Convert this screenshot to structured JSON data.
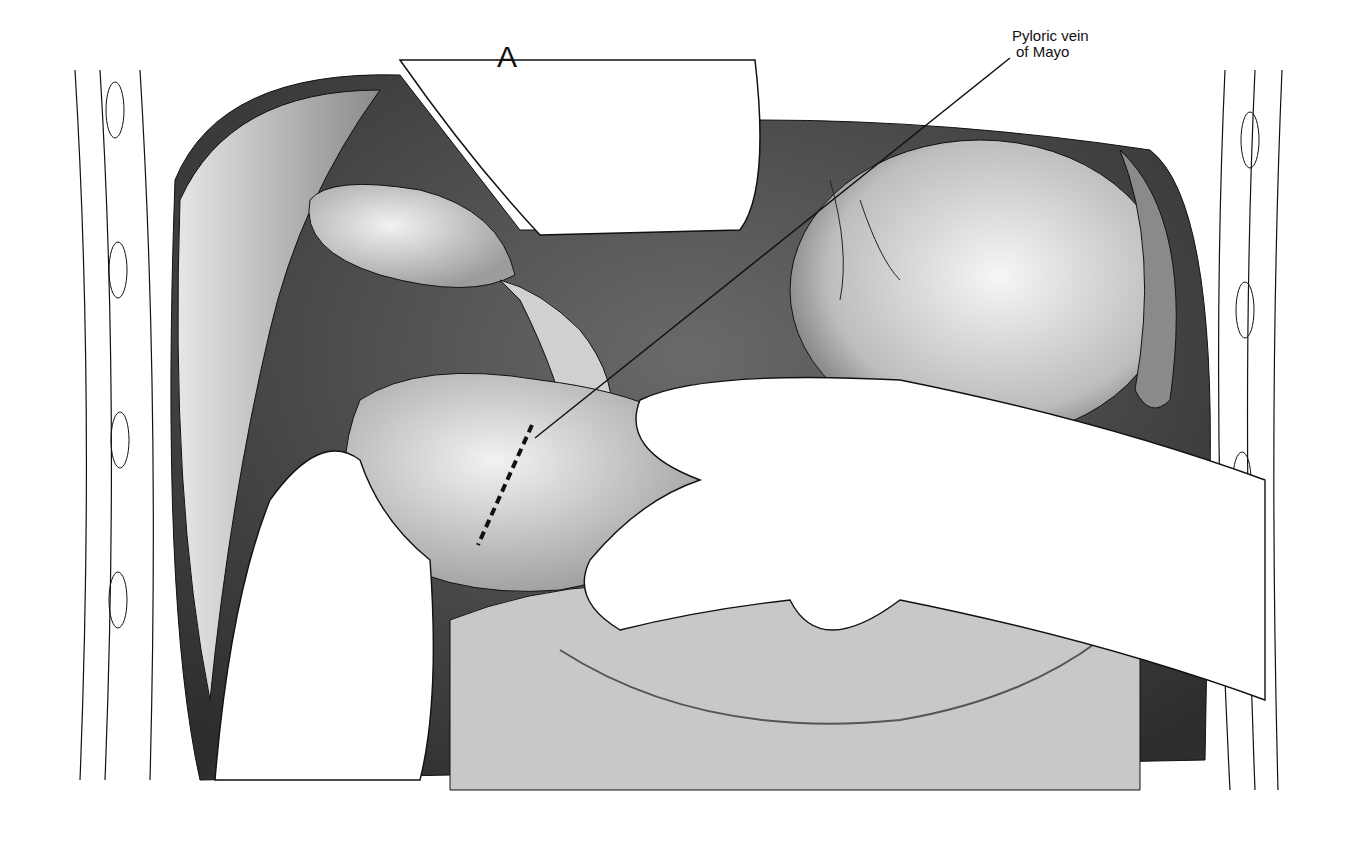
{
  "figure": {
    "panel_letter": "A",
    "labels": [
      {
        "text_line1": "Pyloric vein",
        "text_line2": "of Mayo"
      }
    ],
    "colors": {
      "background": "#ffffff",
      "line": "#111111",
      "shadow_dark": "#4a4a4a",
      "mid_gray": "#9a9a9a",
      "light_gray": "#d8d8d8"
    }
  }
}
